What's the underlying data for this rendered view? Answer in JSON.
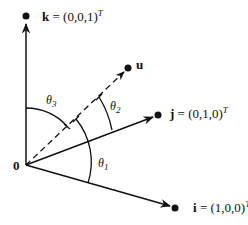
{
  "diagram": {
    "type": "vector-angle-diagram",
    "origin": {
      "label": "0"
    },
    "vectors": [
      {
        "id": "k",
        "name": "k",
        "value": "(0,0,1)",
        "superscript": "T",
        "style": "solid"
      },
      {
        "id": "u",
        "name": "u",
        "value": "",
        "superscript": "",
        "style": "dashed"
      },
      {
        "id": "j",
        "name": "j",
        "value": "(0,1,0)",
        "superscript": "T",
        "style": "solid"
      },
      {
        "id": "i",
        "name": "i",
        "value": "(1,0,0)",
        "superscript": "T",
        "style": "solid"
      }
    ],
    "angles": [
      {
        "id": "theta1",
        "symbol": "θ",
        "subscript": "1",
        "between": [
          "i",
          "u"
        ]
      },
      {
        "id": "theta2",
        "symbol": "θ",
        "subscript": "2",
        "between": [
          "j",
          "u"
        ]
      },
      {
        "id": "theta3",
        "symbol": "θ",
        "subscript": "3",
        "between": [
          "k",
          "u"
        ]
      }
    ],
    "colors": {
      "ink": "#111111",
      "background": "#ffffff"
    }
  },
  "labels": {
    "origin": "0",
    "k_name": "k",
    "k_eq": " = (0,0,1)",
    "k_sup": "T",
    "u_name": "u",
    "j_name": "j",
    "j_eq": " = (0,1,0)",
    "j_sup": "T",
    "i_name": "i",
    "i_eq": " = (1,0,0)",
    "i_sup": "T",
    "theta": "θ",
    "theta1_sub": "1",
    "theta2_sub": "2",
    "theta3_sub": "3"
  }
}
